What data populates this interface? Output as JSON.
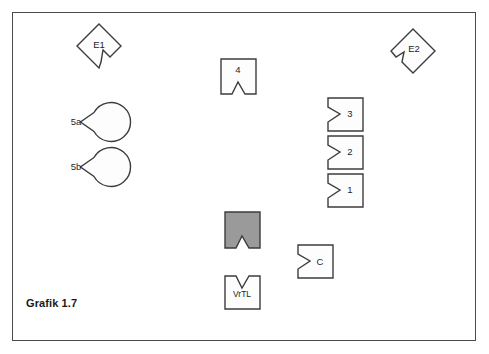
{
  "figure": {
    "caption": "Grafik 1.7",
    "background_color": "#ffffff",
    "frame_color": "#4a4a4a",
    "outline_color": "#3c3c3c",
    "shape_fill": "#fdfdfd",
    "highlight_fill": "#9a9a9a",
    "label_color": "#1f1f1f"
  },
  "shapes": [
    {
      "id": "e1",
      "label": "E1",
      "form": "diamond-notched",
      "notch_side": "bottom-right",
      "fill": "#fdfdfd",
      "center_x": 99,
      "center_y": 46
    },
    {
      "id": "e2",
      "label": "E2",
      "form": "diamond-notched",
      "notch_side": "bottom-left",
      "fill": "#fdfdfd",
      "center_x": 413,
      "center_y": 51
    },
    {
      "id": "four",
      "label": "4",
      "form": "rect-notch-bottom",
      "notch_side": "bottom",
      "fill": "#fdfdfd",
      "center_x": 238,
      "center_y": 76
    },
    {
      "id": "five-a",
      "label": "5a",
      "form": "circle-notched",
      "notch_side": "right",
      "fill": "#fdfdfd",
      "center_x": 77,
      "center_y": 122
    },
    {
      "id": "five-b",
      "label": "5b",
      "form": "circle-notched",
      "notch_side": "right",
      "fill": "#fdfdfd",
      "center_x": 77,
      "center_y": 167
    },
    {
      "id": "three",
      "label": "3",
      "form": "rect-notch-left",
      "notch_side": "left",
      "fill": "#fdfdfd",
      "center_x": 345,
      "center_y": 114
    },
    {
      "id": "two",
      "label": "2",
      "form": "rect-notch-left",
      "notch_side": "left",
      "fill": "#fdfdfd",
      "center_x": 345,
      "center_y": 151
    },
    {
      "id": "one",
      "label": "1",
      "form": "rect-notch-left",
      "notch_side": "left",
      "fill": "#fdfdfd",
      "center_x": 345,
      "center_y": 190
    },
    {
      "id": "highlight",
      "label": "",
      "form": "rect-notch-bottom",
      "notch_side": "bottom",
      "fill": "#9a9a9a",
      "center_x": 242,
      "center_y": 230
    },
    {
      "id": "c",
      "label": "C",
      "form": "rect-notch-left",
      "notch_side": "left",
      "fill": "#fdfdfd",
      "center_x": 315,
      "center_y": 261
    },
    {
      "id": "vrtl",
      "label": "VrTL",
      "form": "rect-notch-top",
      "notch_side": "top",
      "fill": "#fdfdfd",
      "center_x": 242,
      "center_y": 292
    }
  ]
}
